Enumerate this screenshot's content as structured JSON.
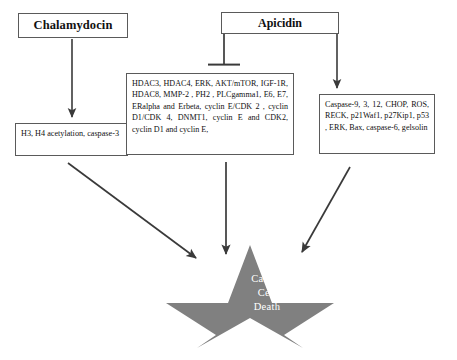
{
  "diagram": {
    "title_nodes": {
      "chalamydocin": "Chalamydocin",
      "apicidin": "Apicidin"
    },
    "effect_nodes": {
      "acetylation": "H3, H4 acetylation, caspase-3",
      "hdac_targets": "HDAC3, HDAC4, ERK, AKT/mTOR, IGF-1R, HDAC8, MMP-2 , PH2 , PLCgamma1, E6, E7, ERalpha and Erbeta, cyclin E/CDK 2 , cyclin D1/CDK 4, DNMT1, cyclin E and CDK2, cyclin D1 and cyclin E,",
      "caspase_targets": "Caspase-9, 3, 12, CHOP, ROS, RECK, p21Waf1, p27Kip1, p53 , ERK, Bax, caspase-6, gelsolin"
    },
    "outcome": {
      "line1": "Cancer",
      "line2": "Cell",
      "line3": "Death"
    },
    "connectors": [
      {
        "name": "chalamydocin-to-acetylation",
        "kind": "arrow"
      },
      {
        "name": "apicidin-to-hdac-targets",
        "kind": "inhibition-tbar"
      },
      {
        "name": "apicidin-to-caspase-targets",
        "kind": "arrow"
      },
      {
        "name": "acetylation-to-cancer-cell-death",
        "kind": "arrow"
      },
      {
        "name": "hdac-targets-to-cancer-cell-death",
        "kind": "arrow"
      },
      {
        "name": "caspase-targets-to-cancer-cell-death",
        "kind": "arrow"
      }
    ],
    "colors": {
      "star_fill": "#808080",
      "connector_stroke": "#3a3a3a",
      "box_border": "#5a5a5a",
      "outcome_text": "#ffffff",
      "background": "#ffffff"
    }
  }
}
